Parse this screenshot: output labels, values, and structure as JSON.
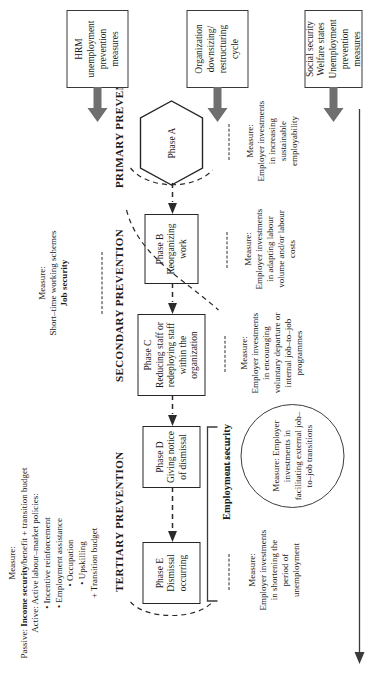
{
  "top_measure": {
    "lead": "Measure:",
    "passive_prefix": "Passive: ",
    "passive_bold": "Income security",
    "passive_suffix": "/benefit + transition budget",
    "active": "Active: Active labour–market policies:",
    "bullets": [
      "Incentive reinforcement",
      "Employment assistance",
      "Occupation",
      "Upskilling"
    ],
    "plus_item": "+ Transition budget"
  },
  "job_security_measure": {
    "lead": "Measure:",
    "line": "Short–time working schemes",
    "bold": "Job security"
  },
  "headings": {
    "primary": "PRIMARY PREVENTION",
    "secondary": "SECONDARY PREVENTION",
    "tertiary": "TERTIARY PREVENTION",
    "employment_security": "Employment security"
  },
  "phases": [
    {
      "id": "A",
      "label": "Phase A",
      "desc": "",
      "shape": "hexagon"
    },
    {
      "id": "B",
      "label": "Phase B",
      "desc": "Reorganizing work",
      "shape": "rect"
    },
    {
      "id": "C",
      "label": "Phase C",
      "desc": "Reducing staff or redeploying staff within the organization",
      "shape": "rect"
    },
    {
      "id": "D",
      "label": "Phase D",
      "desc": "Giving notice of dismissal",
      "shape": "rect"
    },
    {
      "id": "E",
      "label": "Phase E",
      "desc": "Dismissal occurring",
      "shape": "rect"
    }
  ],
  "measures": [
    {
      "for_phase": "A",
      "lead": "Measure:",
      "body": "Employer investments in increasing sustainable employability"
    },
    {
      "for_phase": "B",
      "lead": "Measure:",
      "body": "Employer investments in adapting labour volume and/or labour costs"
    },
    {
      "for_phase": "C",
      "lead": "Measure:",
      "body": "Employer investments in encouraging voluntary departure or internal job–to–job programmes"
    },
    {
      "for_phase": "D",
      "lead": "Measure:",
      "body": "Employer investments in facilitating external job–to–job transitions",
      "enclosed_in_ellipse": true
    },
    {
      "for_phase": "E",
      "lead": "Measure:",
      "body": "Employer investments in shortening the period of unemployment"
    }
  ],
  "sources": [
    {
      "id": "social-security",
      "lines": "Social security Welfare states Unemployment prevention measures"
    },
    {
      "id": "organization-cycle",
      "lines": "Organization downsizing/ restructuring cycle"
    },
    {
      "id": "hrm",
      "lines": "HRM unemployment prevention measures"
    }
  ],
  "colors": {
    "ink": "#1a1a1a",
    "stroke": "#262626",
    "arrow_fill": "#6f6f6f",
    "dash": "#2b2b2b"
  }
}
